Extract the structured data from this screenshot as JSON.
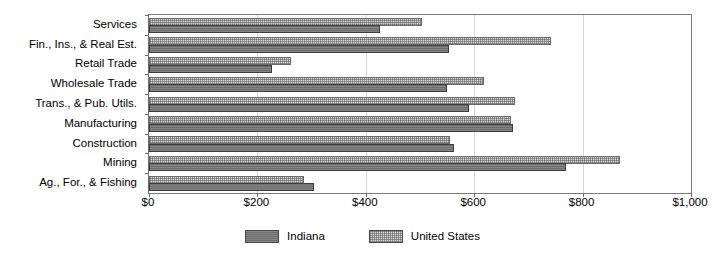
{
  "chart_data": {
    "type": "bar",
    "orientation": "horizontal",
    "title": "",
    "xlabel": "",
    "ylabel": "",
    "xlim": [
      0,
      1000
    ],
    "grid": true,
    "legend_position": "bottom-center",
    "categories": [
      "Services",
      "Fin., Ins., & Real Est.",
      "Retail Trade",
      "Wholesale Trade",
      "Trans., & Pub. Utils.",
      "Manufacturing",
      "Construction",
      "Mining",
      "Ag., For., & Fishing"
    ],
    "series": [
      {
        "name": "Indiana",
        "color": "#6e6e6e",
        "values": [
          426,
          553,
          227,
          550,
          590,
          672,
          563,
          770,
          305
        ]
      },
      {
        "name": "United States",
        "color": "#d9d9d9",
        "values": [
          504,
          742,
          262,
          618,
          676,
          668,
          556,
          869,
          286
        ]
      }
    ],
    "xticks": [
      0,
      200,
      400,
      600,
      800,
      1000
    ],
    "xtick_labels": [
      "$0",
      "$200",
      "$400",
      "$600",
      "$800",
      "$1,000"
    ]
  },
  "legend": {
    "items": [
      {
        "label": "Indiana",
        "swatch": "indiana-swatch"
      },
      {
        "label": "United States",
        "swatch": "united-states-swatch"
      }
    ]
  }
}
